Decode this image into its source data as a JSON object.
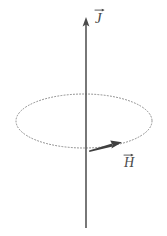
{
  "figure": {
    "type": "vector-diagram",
    "background_color": "#ffffff",
    "width": 167,
    "height": 236,
    "stroke_color": "#565656",
    "dotted_color": "#8a8a8a",
    "arrow_color": "#3f3f3f",
    "label_color": "#4a4a4a"
  },
  "axis": {
    "name": "vertical-axis",
    "x": 86,
    "y_top": 18,
    "y_bottom": 228,
    "arrowhead_at": "top",
    "label": "J",
    "label_accent": "vector-arrow",
    "label_x": 95,
    "label_y": 7
  },
  "ellipse": {
    "name": "field-loop",
    "center_x": 84,
    "center_y": 121,
    "radius_x": 68,
    "radius_y": 27,
    "style": "dotted",
    "fill": "none"
  },
  "field_arrow": {
    "name": "H-vector",
    "label": "H",
    "label_accent": "vector-arrow",
    "start_x": 89,
    "start_y": 150,
    "end_x": 121,
    "end_y": 142,
    "direction": "counterclockwise-tangent",
    "label_x": 124,
    "label_y": 152
  },
  "labels": {
    "current_density": "J",
    "magnetic_field": "H"
  }
}
